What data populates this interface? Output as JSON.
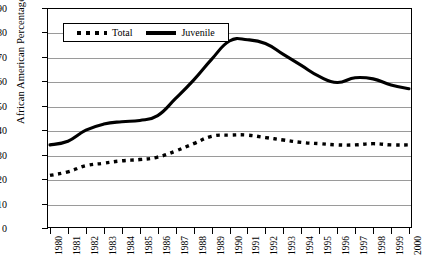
{
  "chart_data": {
    "type": "line",
    "title": "",
    "xlabel": "",
    "ylabel": "African American Percentage",
    "ylim": [
      0,
      90
    ],
    "ytick_step": 10,
    "yticks": [
      0,
      10,
      20,
      30,
      40,
      50,
      60,
      70,
      80,
      90
    ],
    "grid": true,
    "legend_position": "top-left-inside",
    "categories": [
      "1980",
      "1981",
      "1982",
      "1983",
      "1984",
      "1985",
      "1986",
      "1987",
      "1988",
      "1989",
      "1990",
      "1991",
      "1992",
      "1993",
      "1994",
      "1995",
      "1996",
      "1997",
      "1998",
      "1999",
      "2000"
    ],
    "series": [
      {
        "name": "Total",
        "style": "dotted",
        "color": "#000000",
        "values": [
          21.5,
          23.0,
          25.5,
          26.5,
          27.5,
          28.0,
          29.0,
          31.5,
          34.5,
          37.5,
          38.0,
          38.0,
          37.0,
          36.0,
          35.0,
          34.5,
          34.0,
          34.0,
          34.5,
          34.0,
          34.0
        ]
      },
      {
        "name": "Juvenile",
        "style": "solid",
        "color": "#000000",
        "values": [
          34.0,
          35.5,
          40.0,
          42.5,
          43.5,
          44.0,
          46.0,
          53.0,
          60.5,
          69.0,
          76.5,
          77.0,
          75.5,
          71.0,
          66.5,
          62.0,
          59.5,
          61.5,
          61.0,
          58.5,
          57.0
        ]
      }
    ]
  },
  "legend": {
    "items": [
      {
        "label": "Total",
        "style": "dotted"
      },
      {
        "label": "Juvenile",
        "style": "solid"
      }
    ]
  },
  "axes": {
    "y_title": "African American Percentage"
  }
}
